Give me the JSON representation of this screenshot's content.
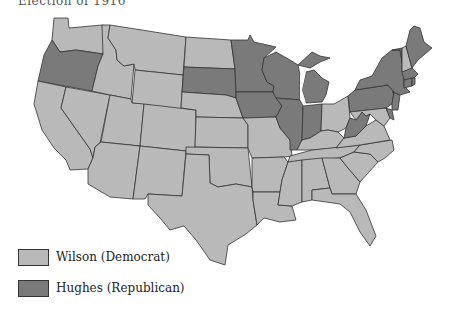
{
  "title": "Election of 1916",
  "colors": {
    "wilson": "#b9b9b9",
    "hughes": "#7a7a7a",
    "border": "#333333"
  },
  "legend": [
    {
      "label": "Wilson (Democrat)",
      "party": "wilson"
    },
    {
      "label": "Hughes (Republican)",
      "party": "hughes"
    }
  ],
  "states": {
    "wilson": [
      "Washington",
      "California",
      "Nevada",
      "Idaho",
      "Montana",
      "Wyoming",
      "Utah",
      "Arizona",
      "Colorado",
      "New Mexico",
      "North Dakota",
      "Nebraska",
      "Kansas",
      "Oklahoma",
      "Texas",
      "Missouri",
      "Arkansas",
      "Louisiana",
      "Kentucky",
      "Tennessee",
      "Mississippi",
      "Alabama",
      "Georgia",
      "Florida",
      "South Carolina",
      "North Carolina",
      "Virginia",
      "Maryland",
      "Ohio",
      "New Hampshire"
    ],
    "hughes": [
      "Oregon",
      "South Dakota",
      "Minnesota",
      "Iowa",
      "Wisconsin",
      "Illinois",
      "Indiana",
      "Michigan",
      "West Virginia",
      "Pennsylvania",
      "New York",
      "New Jersey",
      "Delaware",
      "Connecticut",
      "Rhode Island",
      "Massachusetts",
      "Vermont",
      "Maine"
    ]
  }
}
